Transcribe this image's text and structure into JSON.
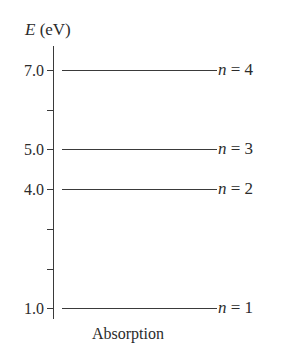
{
  "diagram": {
    "axis_title_var": "E",
    "axis_title_unit": " (eV)",
    "footer_label": "Absorption",
    "ticks": [
      {
        "label": "7.0",
        "value": 7.0,
        "major": true
      },
      {
        "label": "",
        "value": 6.0,
        "major": false
      },
      {
        "label": "5.0",
        "value": 5.0,
        "major": true
      },
      {
        "label": "4.0",
        "value": 4.0,
        "major": true
      },
      {
        "label": "",
        "value": 3.0,
        "major": false
      },
      {
        "label": "",
        "value": 2.0,
        "major": false
      },
      {
        "label": "1.0",
        "value": 1.0,
        "major": true
      }
    ],
    "levels": [
      {
        "n_var": "n",
        "eq": " = 4",
        "energy_eV": 7.0
      },
      {
        "n_var": "n",
        "eq": " = 3",
        "energy_eV": 5.0
      },
      {
        "n_var": "n",
        "eq": " = 2",
        "energy_eV": 4.0
      },
      {
        "n_var": "n",
        "eq": " = 1",
        "energy_eV": 1.0
      }
    ],
    "colors": {
      "line": "#3a3a3a",
      "text": "#2b2b2b",
      "background": "#ffffff"
    }
  }
}
